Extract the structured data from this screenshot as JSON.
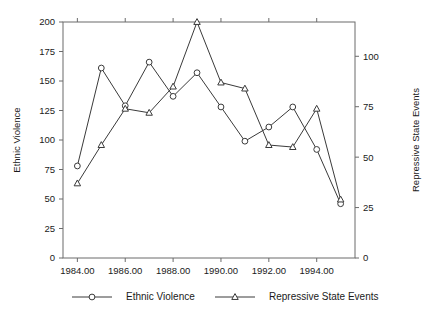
{
  "chart_data": {
    "type": "line",
    "title": "",
    "xlabel": "",
    "ylabel": "Ethnic Violence",
    "y2label": "Repressive State Events",
    "x": [
      1984,
      1985,
      1986,
      1987,
      1988,
      1989,
      1990,
      1991,
      1992,
      1993,
      1994,
      1995
    ],
    "xlim": [
      1983.4,
      1995.6
    ],
    "ylim": [
      0,
      200
    ],
    "y2lim": [
      0,
      117
    ],
    "grid": false,
    "legend_position": "bottom",
    "xticks": [
      "1984.00",
      "1986.00",
      "1988.00",
      "1990.00",
      "1992.00",
      "1994.00"
    ],
    "xtick_values": [
      1984,
      1986,
      1988,
      1990,
      1992,
      1994
    ],
    "yticks": [
      "0",
      "25",
      "50",
      "75",
      "100",
      "125",
      "150",
      "175",
      "200"
    ],
    "ytick_values": [
      0,
      25,
      50,
      75,
      100,
      125,
      150,
      175,
      200
    ],
    "y2ticks": [
      "0",
      "25",
      "50",
      "75",
      "100"
    ],
    "y2tick_values": [
      0,
      25,
      50,
      75,
      100
    ],
    "series": [
      {
        "name": "Ethnic Violence",
        "axis": "left",
        "marker": "circle",
        "color": "#3a3a3a",
        "values": [
          78,
          161,
          129,
          166,
          137,
          157,
          128,
          99,
          111,
          128,
          92,
          46
        ]
      },
      {
        "name": "Repressive State Events",
        "axis": "right",
        "marker": "triangle",
        "color": "#3a3a3a",
        "values": [
          37,
          56,
          74,
          72,
          85,
          117,
          87,
          84,
          56,
          55,
          74,
          29
        ]
      }
    ],
    "legend": [
      {
        "label": "Ethnic Violence",
        "marker": "circle"
      },
      {
        "label": "Repressive State Events",
        "marker": "triangle"
      }
    ]
  }
}
